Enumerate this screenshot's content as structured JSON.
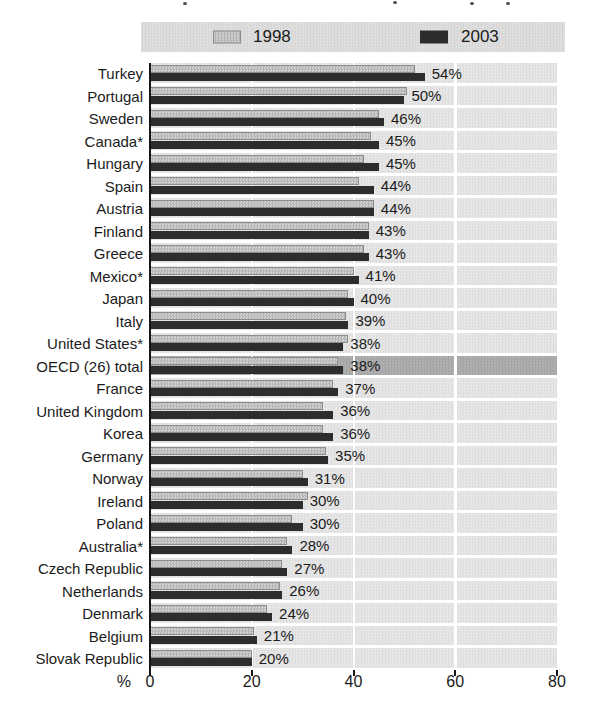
{
  "figure": {
    "note": "top of figure title cropped out of screenshot; only letter fragments visible",
    "axis_unit_label": "%"
  },
  "chart_data": {
    "type": "bar",
    "orientation": "horizontal",
    "unit": "%",
    "xlim": [
      0,
      80
    ],
    "xticks": [
      0,
      20,
      40,
      60,
      80
    ],
    "grid": "vertical white gridlines at 20, 40, 60 over shaded row bands",
    "legend_position": "top",
    "legend": [
      {
        "label": "1998",
        "series": "1998"
      },
      {
        "label": "2003",
        "series": "2003"
      }
    ],
    "highlighted_category": "OECD (26) total",
    "categories": [
      "Turkey",
      "Portugal",
      "Sweden",
      "Canada*",
      "Hungary",
      "Spain",
      "Austria",
      "Finland",
      "Greece",
      "Mexico*",
      "Japan",
      "Italy",
      "United States*",
      "OECD (26) total",
      "France",
      "United Kingdom",
      "Korea",
      "Germany",
      "Norway",
      "Ireland",
      "Poland",
      "Australia*",
      "Czech Republic",
      "Netherlands",
      "Denmark",
      "Belgium",
      "Slovak Republic"
    ],
    "series": [
      {
        "name": "1998",
        "note": "values estimated from bar lengths; not labelled in figure",
        "values": [
          52,
          50.5,
          45,
          43.5,
          42,
          41,
          44,
          43,
          42,
          40,
          39,
          38.5,
          39,
          37,
          36,
          34,
          34,
          34.5,
          30,
          31,
          28,
          27,
          26,
          25.5,
          23,
          20.5,
          20
        ]
      },
      {
        "name": "2003",
        "values": [
          54,
          50,
          46,
          45,
          45,
          44,
          44,
          43,
          43,
          41,
          40,
          39,
          38,
          38,
          37,
          36,
          36,
          35,
          31,
          30,
          30,
          28,
          27,
          26,
          24,
          21,
          20
        ]
      }
    ],
    "value_labels": [
      "54%",
      "50%",
      "46%",
      "45%",
      "45%",
      "44%",
      "44%",
      "43%",
      "43%",
      "41%",
      "40%",
      "39%",
      "38%",
      "38%",
      "37%",
      "36%",
      "36%",
      "35%",
      "31%",
      "30%",
      "30%",
      "28%",
      "27%",
      "26%",
      "24%",
      "21%",
      "20%"
    ],
    "colors": {
      "series_1998": "#c4c4c4",
      "series_2003": "#2d2d2d",
      "row_band": "#e3e3e3",
      "highlight_band": "#ababab",
      "legend_band": "#dcdcdc",
      "gridline": "#ffffff",
      "axis": "#161616"
    }
  }
}
